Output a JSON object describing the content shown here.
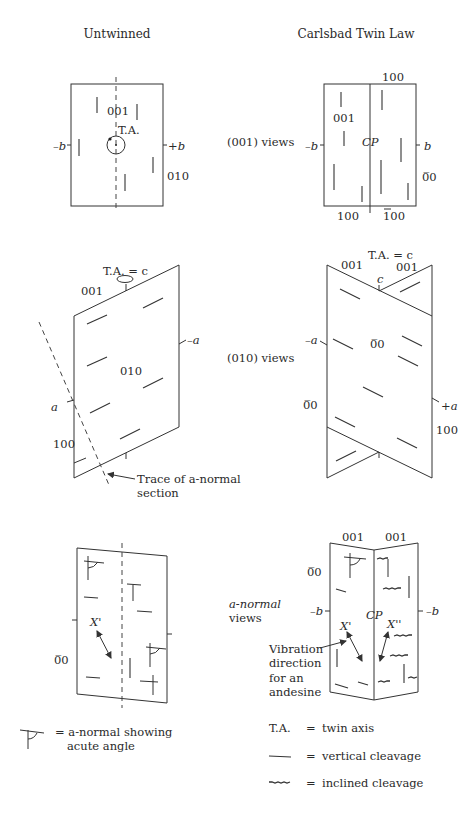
{
  "headers": {
    "left": "Untwinned",
    "right": "Carlsbad Twin Law"
  },
  "row_labels": {
    "view_001": "(001) views",
    "view_010": "(010) views",
    "view_anormal_1": "a-normal",
    "view_anormal_2": "views"
  },
  "untwinned_001": {
    "face_001": "001",
    "twin_axis": "T.A.",
    "minus_b": "–b",
    "plus_b": "+b",
    "face_010": "010"
  },
  "carlsbad_001": {
    "top_100": "100",
    "face_001": "001",
    "cp": "CP",
    "minus_b": "–b",
    "b": "b",
    "face_0_1_0": "0̅0",
    "bottom_100": "100",
    "bottom_bar100": "100"
  },
  "untwinned_010": {
    "ta_c": "T.A. = c",
    "face_001": "001",
    "minus_a": "–a",
    "face_010": "010",
    "a": "a",
    "face_100": "100",
    "trace_label_1": "Trace of a-normal",
    "trace_label_2": "section"
  },
  "carlsbad_010": {
    "ta_c": "T.A. = c",
    "face_001_left": "001",
    "face_001_right": "001",
    "c": "c",
    "minus_a": "–a",
    "face_0_1_0_center": "0̅0",
    "face_0_1_0_left": "0̅0",
    "plus_a": "+a",
    "face_100": "100"
  },
  "untwinned_anormal": {
    "x_prime": "X'",
    "face_0_1_0": "0̅0"
  },
  "carlsbad_anormal": {
    "face_001_left": "001",
    "face_001_right": "001",
    "face_0_1_0": "0̅0",
    "minus_b_left": "–b",
    "minus_b_right": "–b",
    "cp": "CP",
    "x_prime": "X'",
    "x_double_prime": "X''",
    "vibration_1": "Vibration",
    "vibration_2": "direction",
    "vibration_3": "for an",
    "vibration_4": "andesine"
  },
  "legend": {
    "anormal_symbol_1": "= a-normal showing",
    "anormal_symbol_2": "acute angle",
    "ta_key": "T.A.",
    "ta_eq": "=",
    "ta_value": "twin axis",
    "vertical_eq": "=",
    "vertical_value": "vertical cleavage",
    "inclined_eq": "=",
    "inclined_value": "inclined cleavage"
  }
}
